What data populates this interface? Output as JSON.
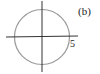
{
  "figure": {
    "label": "(b)",
    "radius_label": "5",
    "circle": {
      "center": [
        0,
        0
      ],
      "radius": 5
    },
    "colors": {
      "circle": "#9a9a9a",
      "axes": "#333333"
    }
  }
}
